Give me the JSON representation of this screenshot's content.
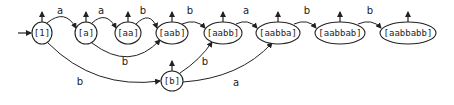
{
  "diagram": {
    "type": "automaton",
    "colors": {
      "stroke": "#222222",
      "background": "#ffffff"
    },
    "start_node": "eps",
    "nodes": [
      {
        "id": "eps",
        "label": "[1]",
        "cx": 42,
        "cy": 33,
        "rx": 10,
        "ry": 11
      },
      {
        "id": "a",
        "label": "[a]",
        "cx": 86,
        "cy": 33,
        "rx": 11,
        "ry": 11
      },
      {
        "id": "aa",
        "label": "[aa]",
        "cx": 128,
        "cy": 33,
        "rx": 13,
        "ry": 11
      },
      {
        "id": "aab",
        "label": "[aab]",
        "cx": 172,
        "cy": 33,
        "rx": 16,
        "ry": 11
      },
      {
        "id": "aabb",
        "label": "[aabb]",
        "cx": 223,
        "cy": 33,
        "rx": 19,
        "ry": 11
      },
      {
        "id": "aabba",
        "label": "[aabba]",
        "cx": 278,
        "cy": 33,
        "rx": 22,
        "ry": 11
      },
      {
        "id": "aabbab",
        "label": "[aabbab]",
        "cx": 340,
        "cy": 33,
        "rx": 25,
        "ry": 11
      },
      {
        "id": "aabbabb",
        "label": "[aabbabb]",
        "cx": 408,
        "cy": 33,
        "rx": 28,
        "ry": 11
      },
      {
        "id": "b",
        "label": "[b]",
        "cx": 172,
        "cy": 81,
        "rx": 11,
        "ry": 10
      }
    ],
    "edges": [
      {
        "from": "eps",
        "to": "a",
        "label": "a",
        "lx": 60,
        "ly": 14
      },
      {
        "from": "a",
        "to": "aa",
        "label": "a",
        "lx": 101,
        "ly": 14
      },
      {
        "from": "aa",
        "to": "aab",
        "label": "b",
        "lx": 143,
        "ly": 14
      },
      {
        "from": "aab",
        "to": "aabb",
        "label": "b",
        "lx": 190,
        "ly": 14
      },
      {
        "from": "aabb",
        "to": "aabba",
        "label": "a",
        "lx": 246,
        "ly": 14
      },
      {
        "from": "aabba",
        "to": "aabbab",
        "label": "b",
        "lx": 307,
        "ly": 14
      },
      {
        "from": "aabbab",
        "to": "aabbabb",
        "label": "b",
        "lx": 370,
        "ly": 14
      },
      {
        "from": "a",
        "to": "aab",
        "label": "b",
        "lx": 125,
        "ly": 65
      },
      {
        "from": "eps",
        "to": "b",
        "label": "b",
        "lx": 80,
        "ly": 85
      },
      {
        "from": "b",
        "to": "aabb",
        "label": "b",
        "lx": 205,
        "ly": 65
      },
      {
        "from": "b",
        "to": "aabba",
        "label": "a",
        "lx": 236,
        "ly": 86
      }
    ],
    "output_arrows": [
      "eps",
      "a",
      "aa",
      "aab",
      "aabb",
      "aabba",
      "aabbab",
      "aabbabb",
      "b"
    ]
  }
}
